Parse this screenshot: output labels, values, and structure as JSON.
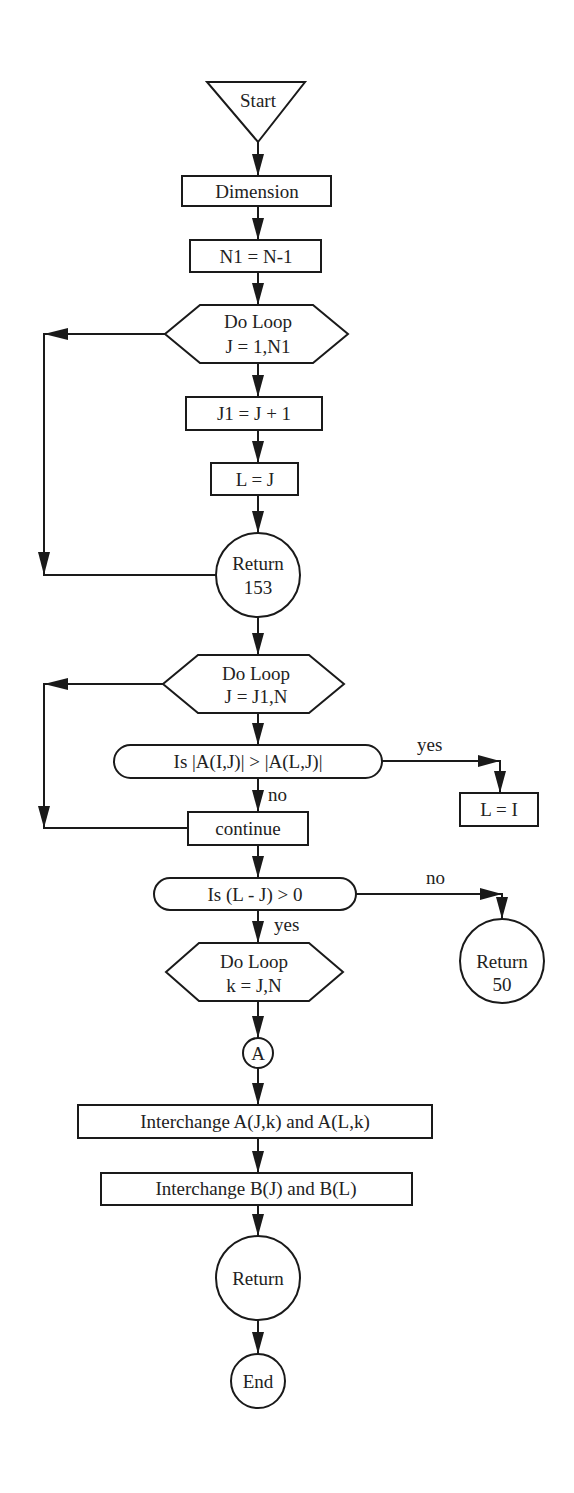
{
  "diagram": {
    "type": "flowchart",
    "colors": {
      "stroke": "#1a1a1a",
      "text": "#222222",
      "background": "#ffffff"
    },
    "nodes": {
      "start": {
        "shape": "inverted-triangle",
        "label": "Start"
      },
      "dimension": {
        "shape": "rectangle",
        "label": "Dimension"
      },
      "n1": {
        "shape": "rectangle",
        "label": "N1 = N-1"
      },
      "loop1": {
        "shape": "hexagon",
        "line1": "Do Loop",
        "line2": "J = 1,N1"
      },
      "j1": {
        "shape": "rectangle",
        "label": "J1 = J + 1"
      },
      "lj": {
        "shape": "rectangle",
        "label": "L = J"
      },
      "return153": {
        "shape": "circle",
        "line1": "Return",
        "line2": "153"
      },
      "loop2": {
        "shape": "hexagon",
        "line1": "Do Loop",
        "line2": "J = J1,N"
      },
      "decision1": {
        "shape": "rounded-pill",
        "label": "Is |A(I,J)| > |A(L,J)|"
      },
      "li": {
        "shape": "rectangle",
        "label": "L = I"
      },
      "continue": {
        "shape": "rectangle",
        "label": "continue"
      },
      "decision2": {
        "shape": "rounded-pill",
        "label": "Is (L - J) > 0"
      },
      "return50": {
        "shape": "circle",
        "line1": "Return",
        "line2": "50"
      },
      "loop3": {
        "shape": "hexagon",
        "line1": "Do Loop",
        "line2": "k = J,N"
      },
      "connectorA": {
        "shape": "small-circle",
        "label": "A"
      },
      "interchangeA": {
        "shape": "rectangle",
        "label": "Interchange A(J,k) and A(L,k)"
      },
      "interchangeB": {
        "shape": "rectangle",
        "label": "Interchange B(J) and B(L)"
      },
      "return": {
        "shape": "circle",
        "label": "Return"
      },
      "end": {
        "shape": "circle",
        "label": "End"
      }
    },
    "edge_labels": {
      "decision1_yes": "yes",
      "decision1_no": "no",
      "decision2_no": "no",
      "decision2_yes": "yes"
    },
    "edges": [
      [
        "start",
        "dimension"
      ],
      [
        "dimension",
        "n1"
      ],
      [
        "n1",
        "loop1"
      ],
      [
        "loop1",
        "j1"
      ],
      [
        "j1",
        "lj"
      ],
      [
        "lj",
        "return153"
      ],
      [
        "return153",
        "loop1",
        "loop-back"
      ],
      [
        "return153",
        "loop2"
      ],
      [
        "loop2",
        "decision1"
      ],
      [
        "decision1",
        "li",
        "yes"
      ],
      [
        "decision1",
        "continue",
        "no"
      ],
      [
        "continue",
        "loop2",
        "loop-back"
      ],
      [
        "continue",
        "decision2"
      ],
      [
        "decision2",
        "return50",
        "no"
      ],
      [
        "decision2",
        "loop3",
        "yes"
      ],
      [
        "loop3",
        "connectorA"
      ],
      [
        "connectorA",
        "interchangeA"
      ],
      [
        "interchangeA",
        "interchangeB"
      ],
      [
        "interchangeB",
        "return"
      ],
      [
        "return",
        "end"
      ]
    ]
  }
}
